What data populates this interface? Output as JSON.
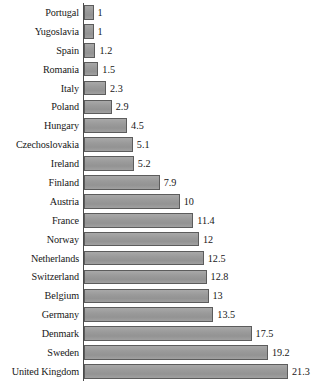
{
  "chart_data": {
    "type": "bar",
    "orientation": "horizontal",
    "title": "",
    "subtitle": "",
    "xlabel": "",
    "ylabel": "",
    "grid": false,
    "legend": null,
    "xlim": [
      0,
      21.3
    ],
    "categories": [
      "Portugal",
      "Yugoslavia",
      "Spain",
      "Romania",
      "Italy",
      "Poland",
      "Hungary",
      "Czechoslovakia",
      "Ireland",
      "Finland",
      "Austria",
      "France",
      "Norway",
      "Netherlands",
      "Switzerland",
      "Belgium",
      "Germany",
      "Denmark",
      "Sweden",
      "United Kingdom"
    ],
    "values": [
      1,
      1,
      1.2,
      1.5,
      2.3,
      2.9,
      4.5,
      5.1,
      5.2,
      7.9,
      10,
      11.4,
      12,
      12.5,
      12.8,
      13,
      13.5,
      17.5,
      19.2,
      21.3
    ],
    "value_labels": [
      "1",
      "1",
      "1.2",
      "1.5",
      "2.3",
      "2.9",
      "4.5",
      "5.1",
      "5.2",
      "7.9",
      "10",
      "11.4",
      "12",
      "12.5",
      "12.8",
      "13",
      "13.5",
      "17.5",
      "19.2",
      "21.3"
    ]
  },
  "style": {
    "bar_fill": "#9b9b9b",
    "bar_border": "#5c5c5c",
    "axis_color": "#4a4a4a",
    "text_color": "#171717",
    "background": "#ffffff"
  }
}
